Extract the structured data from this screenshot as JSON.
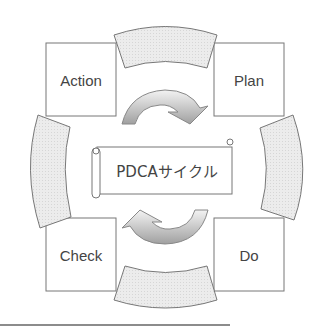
{
  "diagram": {
    "title": "PDCAサイクル",
    "stages": [
      {
        "id": "plan",
        "label": "Plan",
        "position": "top-right"
      },
      {
        "id": "do",
        "label": "Do",
        "position": "bottom-right"
      },
      {
        "id": "check",
        "label": "Check",
        "position": "bottom-left"
      },
      {
        "id": "action",
        "label": "Action",
        "position": "top-left"
      }
    ],
    "connectors": [
      {
        "from": "action",
        "to": "plan",
        "shape": "arc-segment",
        "position": "top"
      },
      {
        "from": "plan",
        "to": "do",
        "shape": "arc-segment",
        "position": "right"
      },
      {
        "from": "do",
        "to": "check",
        "shape": "arc-segment",
        "position": "bottom"
      },
      {
        "from": "check",
        "to": "action",
        "shape": "arc-segment",
        "position": "left"
      }
    ],
    "center_arrows": [
      {
        "position": "upper",
        "direction": "clockwise",
        "icon": "curved-arrow-down-right"
      },
      {
        "position": "lower",
        "direction": "clockwise",
        "icon": "curved-arrow-up-left"
      }
    ],
    "colors": {
      "stroke": "#777777",
      "arc_fill": "#e6e6e6",
      "arrow_fill_light": "#f2f2f2",
      "arrow_fill_dark": "#9a9a9a",
      "text": "#444444",
      "background": "#ffffff"
    }
  }
}
